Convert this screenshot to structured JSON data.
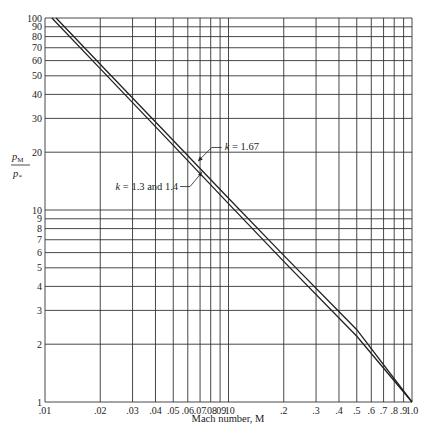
{
  "chart_data": {
    "type": "line",
    "title": "",
    "xlabel": "Mach number, M",
    "ylabel": "pM / p*",
    "ylabel_num": "p",
    "ylabel_num_sub": "M",
    "ylabel_den": "p",
    "ylabel_den_sub": "*",
    "xscale": "log",
    "yscale": "log",
    "xlim": [
      0.01,
      1.0
    ],
    "ylim": [
      1,
      100
    ],
    "grid": true,
    "x_ticks": [
      0.01,
      0.02,
      0.03,
      0.04,
      0.05,
      0.06,
      0.07,
      0.08,
      0.09,
      0.1,
      0.2,
      0.3,
      0.4,
      0.5,
      0.6,
      0.7,
      0.8,
      0.9,
      1.0
    ],
    "x_tick_labels": [
      ".01",
      ".02",
      ".03",
      ".04",
      ".05",
      ".06",
      ".07",
      ".08",
      ".09",
      ".10",
      ".2",
      ".3",
      ".4",
      ".5",
      ".6",
      ".7",
      ".8",
      ".9",
      "1.0"
    ],
    "y_ticks": [
      1,
      2,
      3,
      4,
      5,
      6,
      7,
      8,
      9,
      10,
      20,
      30,
      40,
      50,
      60,
      70,
      80,
      90,
      100
    ],
    "y_tick_labels": [
      "1",
      "2",
      "3",
      "4",
      "5",
      "6",
      "7",
      "8",
      "9",
      "10",
      "20",
      "30",
      "40",
      "50",
      "60",
      "70",
      "80",
      "90",
      "100"
    ],
    "series": [
      {
        "name": "k = 1.67",
        "x": [
          0.0115,
          0.02,
          0.05,
          0.1,
          0.2,
          0.5,
          1.0
        ],
        "y": [
          100,
          57.4,
          23.0,
          11.5,
          5.8,
          2.38,
          1.0
        ]
      },
      {
        "name": "k = 1.3 and 1.4",
        "x": [
          0.0109,
          0.02,
          0.05,
          0.1,
          0.2,
          0.5,
          1.0
        ],
        "y": [
          100,
          54.5,
          21.7,
          10.8,
          5.4,
          2.2,
          1.0
        ]
      }
    ],
    "annotations": [
      {
        "text": "k = 1.67",
        "target_series": 0,
        "at": [
          0.068,
          19
        ]
      },
      {
        "text": "k = 1.3 and 1.4",
        "target_series": 1,
        "at": [
          0.07,
          15.3
        ]
      }
    ]
  }
}
